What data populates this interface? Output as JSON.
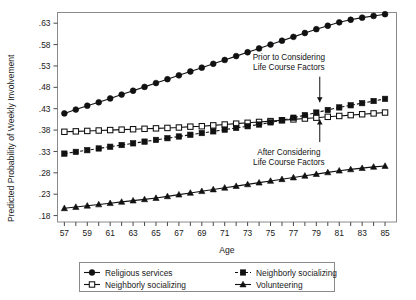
{
  "chart_data": {
    "type": "line",
    "title": "",
    "xlabel": "Age",
    "ylabel": "Predicted Probability of Weekly Involvement",
    "xlim": [
      56.4,
      86.0
    ],
    "ylim": [
      0.165,
      0.655
    ],
    "xticks": [
      57,
      58,
      59,
      60,
      61,
      62,
      63,
      64,
      65,
      66,
      67,
      68,
      69,
      70,
      71,
      72,
      73,
      74,
      75,
      76,
      77,
      78,
      79,
      80,
      81,
      82,
      83,
      84,
      85
    ],
    "xticklabels": [
      "57",
      "",
      "59",
      "",
      "61",
      "",
      "63",
      "",
      "65",
      "",
      "67",
      "",
      "69",
      "",
      "71",
      "",
      "73",
      "",
      "75",
      "",
      "77",
      "",
      "79",
      "",
      "81",
      "",
      "83",
      "",
      "85"
    ],
    "yticks": [
      0.18,
      0.23,
      0.28,
      0.33,
      0.38,
      0.43,
      0.48,
      0.53,
      0.58,
      0.63
    ],
    "yticklabels": [
      ".18",
      ".23",
      ".28",
      ".33",
      ".38",
      ".43",
      ".48",
      ".53",
      ".58",
      ".63"
    ],
    "grid": false,
    "legend_position": "below-plot",
    "x": [
      57,
      58,
      59,
      60,
      61,
      62,
      63,
      64,
      65,
      66,
      67,
      68,
      69,
      70,
      71,
      72,
      73,
      74,
      75,
      76,
      77,
      78,
      79,
      80,
      81,
      82,
      83,
      84,
      85
    ],
    "series": [
      {
        "name": "Religious services",
        "marker": "filled-circle",
        "linestyle": "solid",
        "color": "#111111",
        "values": [
          0.419,
          0.428,
          0.437,
          0.445,
          0.454,
          0.463,
          0.472,
          0.481,
          0.49,
          0.499,
          0.508,
          0.517,
          0.526,
          0.535,
          0.544,
          0.553,
          0.562,
          0.571,
          0.58,
          0.589,
          0.598,
          0.607,
          0.616,
          0.624,
          0.632,
          0.638,
          0.643,
          0.647,
          0.651
        ]
      },
      {
        "name": "Neighborly socializing",
        "marker": "open-square",
        "linestyle": "solid",
        "color": "#111111",
        "values": [
          0.376,
          0.377,
          0.378,
          0.379,
          0.38,
          0.381,
          0.382,
          0.383,
          0.384,
          0.385,
          0.386,
          0.388,
          0.389,
          0.391,
          0.393,
          0.395,
          0.397,
          0.399,
          0.401,
          0.403,
          0.405,
          0.407,
          0.409,
          0.411,
          0.413,
          0.415,
          0.417,
          0.419,
          0.421
        ]
      },
      {
        "name": "Neighborly socializing",
        "marker": "filled-square",
        "linestyle": "dashed",
        "color": "#111111",
        "values": [
          0.325,
          0.329,
          0.333,
          0.337,
          0.341,
          0.345,
          0.349,
          0.353,
          0.357,
          0.361,
          0.365,
          0.369,
          0.373,
          0.377,
          0.381,
          0.385,
          0.389,
          0.393,
          0.398,
          0.403,
          0.409,
          0.415,
          0.421,
          0.427,
          0.433,
          0.438,
          0.443,
          0.448,
          0.453
        ]
      },
      {
        "name": "Volunteering",
        "marker": "filled-triangle",
        "linestyle": "solid",
        "color": "#111111",
        "values": [
          0.197,
          0.2,
          0.203,
          0.206,
          0.209,
          0.212,
          0.215,
          0.218,
          0.221,
          0.225,
          0.229,
          0.233,
          0.237,
          0.241,
          0.245,
          0.249,
          0.253,
          0.257,
          0.261,
          0.265,
          0.269,
          0.273,
          0.277,
          0.281,
          0.285,
          0.288,
          0.291,
          0.294,
          0.296
        ]
      }
    ],
    "annotations": [
      {
        "id": "prior",
        "lines": [
          "Prior to Considering",
          "Life Course Factors"
        ],
        "text_x": 76.6,
        "text_y": 0.545,
        "arrow_from": [
          79.3,
          0.505
        ],
        "arrow_to": [
          79.3,
          0.445
        ],
        "arrow_dir": "down",
        "target_series": "Neighborly socializing (filled square)"
      },
      {
        "id": "after",
        "lines": [
          "After Considering",
          "Life Course Factors"
        ],
        "text_x": 76.6,
        "text_y": 0.322,
        "arrow_from": [
          79.3,
          0.352
        ],
        "arrow_to": [
          79.3,
          0.405
        ],
        "arrow_dir": "up",
        "target_series": "Neighborly socializing (open square)"
      }
    ],
    "legend_entries": [
      {
        "label": "Religious services",
        "marker": "filled-circle",
        "linestyle": "solid"
      },
      {
        "label": "Neighborly socializing",
        "marker": "filled-square",
        "linestyle": "dashed"
      },
      {
        "label": "Neighborly socializing",
        "marker": "open-square",
        "linestyle": "solid"
      },
      {
        "label": "Volunteering",
        "marker": "filled-triangle",
        "linestyle": "solid"
      }
    ]
  }
}
